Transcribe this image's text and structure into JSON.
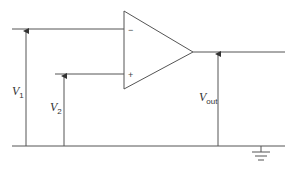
{
  "diagram": {
    "colors": {
      "wire": "#555555",
      "text": "#333333",
      "background": "#ffffff"
    },
    "opamp": {
      "inverting_sign": "−",
      "noninverting_sign": "+"
    },
    "labels": {
      "v1": {
        "main": "V",
        "sub": "1"
      },
      "v2": {
        "main": "V",
        "sub": "2"
      },
      "vout": {
        "main": "V",
        "sub": "out"
      }
    },
    "ground": {
      "symbol": "ground-icon"
    }
  }
}
